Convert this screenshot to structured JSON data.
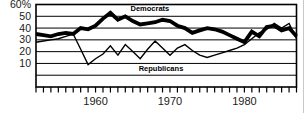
{
  "background_color": "#ffffff",
  "line_color": "#000000",
  "chart_data": {
    "type": "line",
    "x_years": [
      1952,
      1953,
      1954,
      1955,
      1956,
      1957,
      1958,
      1959,
      1960,
      1961,
      1962,
      1963,
      1964,
      1965,
      1966,
      1967,
      1968,
      1969,
      1970,
      1971,
      1972,
      1973,
      1974,
      1975,
      1976,
      1977,
      1978,
      1979,
      1980,
      1981,
      1982,
      1983,
      1984,
      1985,
      1986,
      1987
    ],
    "series": [
      {
        "name": "Democrats",
        "thickness": "thick",
        "values": [
          35,
          34,
          33,
          35,
          36,
          35,
          40,
          39,
          42,
          48,
          53,
          47,
          50,
          46,
          43,
          44,
          45,
          47,
          46,
          42,
          40,
          36,
          38,
          40,
          39,
          37,
          34,
          31,
          28,
          37,
          33,
          41,
          42,
          38,
          40,
          33
        ]
      },
      {
        "name": "Republicans",
        "thickness": "thin",
        "values": [
          28,
          29,
          30,
          31,
          33,
          35,
          22,
          9,
          14,
          18,
          25,
          17,
          26,
          20,
          14,
          22,
          29,
          23,
          17,
          23,
          26,
          21,
          17,
          15,
          17,
          19,
          21,
          23,
          26,
          31,
          36,
          39,
          44,
          40,
          44,
          31
        ]
      }
    ],
    "y_tick_labels": [
      "60%",
      "50",
      "40",
      "30",
      "20",
      "10"
    ],
    "y_tick_values": [
      60,
      50,
      40,
      30,
      20,
      10
    ],
    "y_gridline_values": [
      50,
      40,
      30,
      20,
      10,
      0
    ],
    "ylim": [
      -10,
      60
    ],
    "xlim": [
      1952,
      1987
    ],
    "x_tick_every_year": true,
    "x_tick_label_years": [
      1960,
      1970,
      1980
    ],
    "grid": "horizontal",
    "legend_position": "inline-annotations",
    "annotations": [
      {
        "text": "Democrats",
        "year": 1964.7,
        "value": 57,
        "anchor": "start"
      },
      {
        "text": "Republicans",
        "year": 1965.8,
        "value": 6.5,
        "anchor": "start"
      }
    ]
  }
}
